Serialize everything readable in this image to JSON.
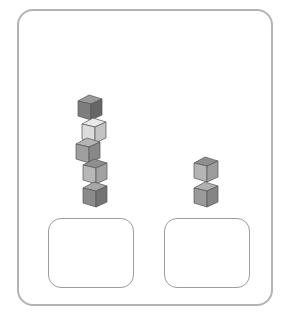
{
  "scene": {
    "description": "Two stacks of cubes above two empty rounded trays",
    "left_stack": {
      "count": 5,
      "cubes": [
        {
          "x": 76,
          "y": 93,
          "shade": "dark",
          "top": "#9a9a9a",
          "front": "#7d7d7d",
          "side": "#666666"
        },
        {
          "x": 80,
          "y": 116,
          "shade": "light",
          "top": "#e9e9e9",
          "front": "#dcdcdc",
          "side": "#c4c4c4"
        },
        {
          "x": 74,
          "y": 136,
          "shade": "medium",
          "top": "#b4b4b4",
          "front": "#9f9f9f",
          "side": "#888888"
        },
        {
          "x": 81,
          "y": 157,
          "shade": "medium",
          "top": "#8e8e8e",
          "front": "#b8b8b8",
          "side": "#a2a2a2"
        },
        {
          "x": 81,
          "y": 180,
          "shade": "dark",
          "top": "#a7a7a7",
          "front": "#8a8a8a",
          "side": "#737373"
        }
      ]
    },
    "right_stack": {
      "count": 2,
      "cubes": [
        {
          "x": 192,
          "y": 155,
          "shade": "medium",
          "top": "#8f8f8f",
          "front": "#b4b4b4",
          "side": "#9d9d9d"
        },
        {
          "x": 192,
          "y": 180,
          "shade": "medium",
          "top": "#b0b0b0",
          "front": "#9a9a9a",
          "side": "#858585"
        }
      ]
    },
    "trays": [
      {
        "name": "left-tray",
        "x": 48,
        "y": 218
      },
      {
        "name": "right-tray",
        "x": 164,
        "y": 218
      }
    ],
    "colors": {
      "frame_border": "#b3b3b3",
      "tray_border": "#9c9c9c",
      "background": "#ffffff"
    }
  }
}
